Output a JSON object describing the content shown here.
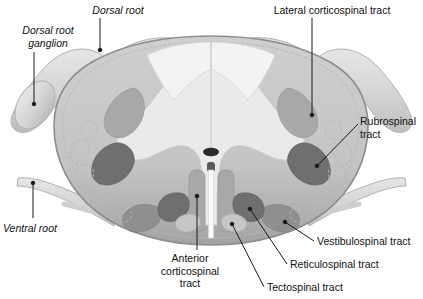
{
  "figure": {
    "background_color": "#ffffff"
  },
  "labels": {
    "dorsal_root": "Dorsal root",
    "dorsal_root_ganglion": "Dorsal root\nganglion",
    "lateral_corticospinal_tract": "Lateral corticospinal tract",
    "rubrospinal_tract": "Rubrospinal\ntract",
    "ventral_root": "Ventral root",
    "anterior_corticospinal_tract": "Anterior\ncorticospinal\ntract",
    "vestibulospinal_tract": "Vestibulospinal tract",
    "reticulospinal_tract": "Reticulospinal tract",
    "tectospinal_tract": "Tectospinal tract"
  },
  "colors": {
    "background": "#ffffff",
    "white_matter": "#c9c9c9",
    "white_matter_edge": "#9a9a9a",
    "gray_matter": "#e9e9e9",
    "dorsal_column": "#f2f2f2",
    "tract_medium": "#a8a8a8",
    "tract_dark": "#6f6f6f",
    "root_fill": "#dcdcdc",
    "root_edge": "#b0b0b0",
    "central_canal": "#2b2b2b",
    "leader_line": "#1a1a1a",
    "text": "#111111"
  },
  "structures": [
    {
      "name": "spinal-cord-outline",
      "kind": "outline"
    },
    {
      "name": "gray-matter-butterfly",
      "kind": "region"
    },
    {
      "name": "dorsal-columns",
      "kind": "region"
    },
    {
      "name": "central-canal",
      "kind": "region"
    },
    {
      "name": "anterior-median-fissure",
      "kind": "region"
    },
    {
      "name": "dorsal-root-left",
      "kind": "nerve-root"
    },
    {
      "name": "dorsal-root-ganglion-left",
      "kind": "nerve-root"
    },
    {
      "name": "dorsal-root-right",
      "kind": "nerve-root"
    },
    {
      "name": "ventral-root-left",
      "kind": "nerve-root"
    },
    {
      "name": "ventral-root-right",
      "kind": "nerve-root"
    },
    {
      "name": "lateral-corticospinal-tract-left",
      "kind": "tract",
      "shade": "medium"
    },
    {
      "name": "lateral-corticospinal-tract-right",
      "kind": "tract",
      "shade": "medium"
    },
    {
      "name": "rubrospinal-tract-left",
      "kind": "tract",
      "shade": "dark"
    },
    {
      "name": "rubrospinal-tract-right",
      "kind": "tract",
      "shade": "dark"
    },
    {
      "name": "anterior-corticospinal-tract-left",
      "kind": "tract",
      "shade": "medium"
    },
    {
      "name": "anterior-corticospinal-tract-right",
      "kind": "tract",
      "shade": "medium"
    },
    {
      "name": "vestibulospinal-tract-left",
      "kind": "tract",
      "shade": "medium"
    },
    {
      "name": "vestibulospinal-tract-right",
      "kind": "tract",
      "shade": "medium"
    },
    {
      "name": "reticulospinal-tract-left",
      "kind": "tract",
      "shade": "dark"
    },
    {
      "name": "reticulospinal-tract-right",
      "kind": "tract",
      "shade": "dark"
    },
    {
      "name": "tectospinal-tract-left",
      "kind": "tract",
      "shade": "light"
    },
    {
      "name": "tectospinal-tract-right",
      "kind": "tract",
      "shade": "light"
    }
  ]
}
